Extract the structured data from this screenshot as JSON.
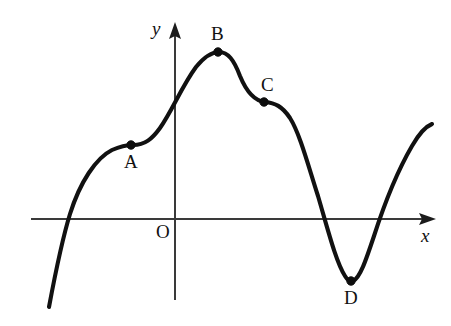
{
  "figure": {
    "kind": "cartesian-curve-diagram",
    "width": 451,
    "height": 326,
    "background_color": "#ffffff",
    "curve_color": "#111111",
    "axis_color": "#3a3a3a",
    "label_color": "#111111"
  },
  "axes": {
    "x_axis": {
      "label": "x",
      "label_x": 421,
      "label_y": 226,
      "start_x": 31,
      "end_x": 436,
      "y": 219,
      "arrow": "right"
    },
    "y_axis": {
      "label": "y",
      "label_x": 152,
      "label_y": 19,
      "x": 175,
      "start_y": 300,
      "end_y": 22,
      "arrow": "up"
    },
    "origin": {
      "label": "O",
      "label_x": 156,
      "label_y": 222,
      "x": 175,
      "y": 219
    }
  },
  "marked_points": [
    {
      "label": "A",
      "x": 131,
      "y": 145,
      "label_x": 124,
      "label_y": 152,
      "role": "inflection-saddle"
    },
    {
      "label": "B",
      "x": 218,
      "y": 52,
      "label_x": 211,
      "label_y": 24,
      "role": "local-maximum"
    },
    {
      "label": "C",
      "x": 264,
      "y": 102,
      "label_x": 261,
      "label_y": 75,
      "role": "inflection-saddle"
    },
    {
      "label": "D",
      "x": 351,
      "y": 281,
      "label_x": 344,
      "label_y": 288,
      "role": "local-minimum"
    }
  ],
  "chart_data": {
    "type": "line",
    "title": "",
    "xlabel": "x",
    "ylabel": "y",
    "grid": false,
    "legend": false,
    "curve_path": "M 49,307 C 55,275 61,243 70,214 C 80,182 96,158 112,150 C 121,146 127,145 133,145 C 145,145 152,139 160,128 C 172,111 182,86 196,67 C 205,56 212,52 219,52 C 228,52 234,60 240,76 C 247,93 255,101 265,102 C 275,103 282,106 290,118 C 300,134 308,165 318,196 C 328,230 336,262 345,276 C 348,281 350,282 353,281 C 360,278 366,260 374,236 C 384,205 398,170 412,146 C 420,132 427,126 432,124",
    "axis_crossings": {
      "x_axis": [
        68,
        325,
        389
      ],
      "y_axis": [
        115
      ]
    },
    "endpoints": {
      "start": [
        49,
        307
      ],
      "end": [
        432,
        124
      ]
    }
  }
}
